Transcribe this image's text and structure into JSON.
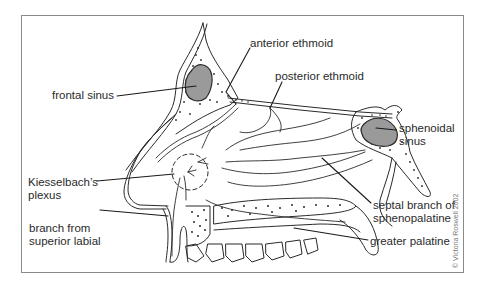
{
  "figure": {
    "labels": {
      "frontal_sinus": "frontal sinus",
      "anterior_ethmoid": "anterior ethmoid",
      "posterior_ethmoid": "posterior ethmoid",
      "sphenoidal_sinus_1": "sphenoidal",
      "sphenoidal_sinus_2": "sinus",
      "kiesselbach_1": "Kiesselbach’s",
      "kiesselbach_2": "plexus",
      "superior_labial_1": "branch from",
      "superior_labial_2": "superior labial",
      "septal_branch_1": "septal branch of",
      "septal_branch_2": "sphenopalatine",
      "greater_palatine": "greater palatine"
    },
    "copyright": "© Victoria Roswell 2002",
    "colors": {
      "line": "#2a2a2a",
      "frame": "#8a8a8a",
      "sinus_fill": "#9a9a9a",
      "background": "#ffffff"
    }
  }
}
